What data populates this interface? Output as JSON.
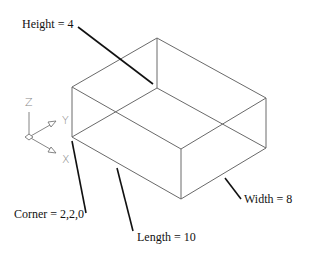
{
  "diagram": {
    "type": "isometric-wireframe-box",
    "colors": {
      "background": "#ffffff",
      "edge": "#6a6a6a",
      "leader": "#111111",
      "text": "#111111",
      "ucs_icon": "#777777"
    },
    "labels": {
      "height": "Height = 4",
      "corner": "Corner = 2,2,0",
      "length": "Length = 10",
      "width": "Width = 8"
    },
    "ucs_icon": {
      "z_label": "Z",
      "y_label": "Y",
      "x_label": "X"
    },
    "box": {
      "corner": [
        2,
        2,
        0
      ],
      "length": 10,
      "width": 8,
      "height": 4
    }
  }
}
